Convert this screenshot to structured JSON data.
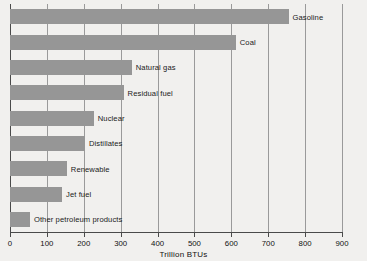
{
  "chart_data": {
    "type": "bar",
    "orientation": "horizontal",
    "title": "",
    "xlabel": "Trillion BTUs",
    "ylabel": "",
    "xlim": [
      0,
      900
    ],
    "ylim": null,
    "grid": true,
    "legend": null,
    "xticks": [
      0,
      100,
      200,
      300,
      400,
      500,
      600,
      700,
      800,
      900
    ],
    "xticklabels": [
      "0",
      "100",
      "200",
      "300",
      "400",
      "500",
      "600",
      "700",
      "800",
      "900"
    ],
    "categories": [
      "Gasoline",
      "Coal",
      "Natural gas",
      "Residual fuel",
      "Nuclear",
      "Distillates",
      "Renewable",
      "Jet fuel",
      "Other petroleum products"
    ],
    "values": [
      755,
      612,
      330,
      308,
      227,
      203,
      154,
      141,
      54
    ],
    "bar_color": "#969696",
    "background_color": "#f1f0ee",
    "gridline_color": "#9a9a9a",
    "axis_color": "#4a4a4a"
  }
}
